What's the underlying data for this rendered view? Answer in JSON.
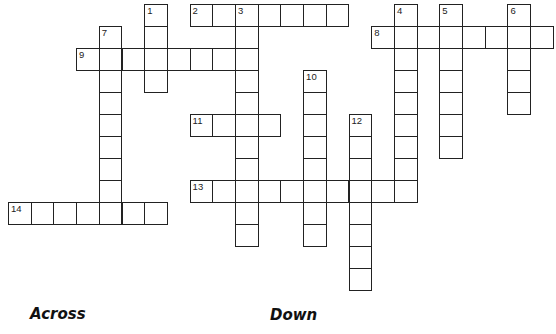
{
  "puzzle": {
    "cell_size": 22.7,
    "origin": {
      "x": 8,
      "y": 4
    },
    "row_height": 22,
    "entries": [
      {
        "number": "1",
        "direction": "down",
        "row": 0,
        "col": 6,
        "length": 4
      },
      {
        "number": "2",
        "direction": "across",
        "row": 0,
        "col": 8,
        "length": 7
      },
      {
        "number": "3",
        "direction": "down",
        "row": 0,
        "col": 10,
        "length": 11
      },
      {
        "number": "4",
        "direction": "down",
        "row": 0,
        "col": 17,
        "length": 9
      },
      {
        "number": "5",
        "direction": "down",
        "row": 0,
        "col": 19,
        "length": 7
      },
      {
        "number": "6",
        "direction": "down",
        "row": 0,
        "col": 22,
        "length": 5
      },
      {
        "number": "7",
        "direction": "down",
        "row": 1,
        "col": 4,
        "length": 9
      },
      {
        "number": "8",
        "direction": "across",
        "row": 1,
        "col": 16,
        "length": 8
      },
      {
        "number": "9",
        "direction": "across",
        "row": 2,
        "col": 3,
        "length": 8
      },
      {
        "number": "10",
        "direction": "down",
        "row": 3,
        "col": 13,
        "length": 8
      },
      {
        "number": "11",
        "direction": "across",
        "row": 5,
        "col": 8,
        "length": 4
      },
      {
        "number": "12",
        "direction": "down",
        "row": 5,
        "col": 15,
        "length": 8
      },
      {
        "number": "13",
        "direction": "across",
        "row": 8,
        "col": 8,
        "length": 10
      },
      {
        "number": "14",
        "direction": "across",
        "row": 9,
        "col": 0,
        "length": 7
      }
    ]
  },
  "clues": {
    "across_heading": "Across",
    "down_heading": "Down"
  }
}
